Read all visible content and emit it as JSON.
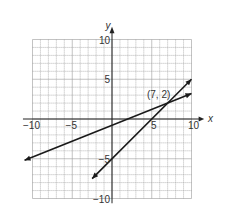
{
  "chart_data": {
    "type": "line",
    "title": "",
    "xlabel": "x",
    "ylabel": "y",
    "xlim": [
      -10,
      10
    ],
    "ylim": [
      -10,
      10
    ],
    "grid": true,
    "x_ticks": [
      -10,
      -5,
      5,
      10
    ],
    "y_ticks": [
      10,
      5,
      -5,
      -10
    ],
    "tick_labels": {
      "x": [
        "−10",
        "−5",
        "5",
        "10"
      ],
      "y": [
        "10",
        "5",
        "−5",
        "−10"
      ]
    },
    "series": [
      {
        "name": "line-steep",
        "equation": "y = x − 5",
        "x": [
          -2.5,
          10
        ],
        "y": [
          -7.5,
          5
        ]
      },
      {
        "name": "line-shallow",
        "equation": "y = 0.4x − 0.8",
        "x": [
          -11,
          10
        ],
        "y": [
          -5.2,
          3.2
        ]
      }
    ],
    "annotations": [
      {
        "text": "(7, 2)",
        "x": 7,
        "y": 2,
        "type": "intersection-point"
      }
    ]
  }
}
